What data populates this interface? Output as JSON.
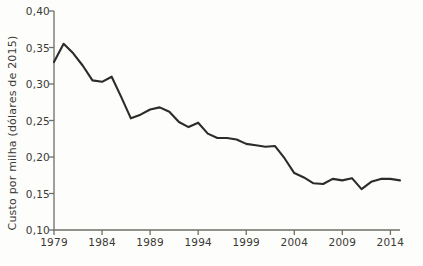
{
  "chart_data": {
    "type": "line",
    "title": "",
    "subtitle": "",
    "xlabel": "",
    "ylabel": "Custo por milha (dólares de 2015)",
    "xlim": [
      1979,
      2015
    ],
    "ylim": [
      0.1,
      0.4
    ],
    "grid": false,
    "legend": null,
    "legend_position": "none",
    "line_color": "#2b2b28",
    "background_color": "#fdfdfb",
    "axis_color": "#6f6f68",
    "y_ticks": [
      0.1,
      0.15,
      0.2,
      0.25,
      0.3,
      0.35,
      0.4
    ],
    "y_tick_labels": [
      "0,10",
      "0,15",
      "0,20",
      "0,25",
      "0,30",
      "0,35",
      "0,40"
    ],
    "x_ticks": [
      1979,
      1984,
      1989,
      1994,
      1999,
      2004,
      2009,
      2014
    ],
    "x_tick_labels": [
      "1979",
      "1984",
      "1989",
      "1994",
      "1999",
      "2004",
      "2009",
      "2014"
    ],
    "x": [
      1979,
      1980,
      1981,
      1982,
      1983,
      1984,
      1985,
      1986,
      1987,
      1988,
      1989,
      1990,
      1991,
      1992,
      1993,
      1994,
      1995,
      1996,
      1997,
      1998,
      1999,
      2000,
      2001,
      2002,
      2003,
      2004,
      2005,
      2006,
      2007,
      2008,
      2009,
      2010,
      2011,
      2012,
      2013,
      2014,
      2015
    ],
    "values": [
      0.33,
      0.355,
      0.342,
      0.325,
      0.305,
      0.303,
      0.31,
      0.282,
      0.253,
      0.258,
      0.265,
      0.268,
      0.262,
      0.248,
      0.241,
      0.247,
      0.232,
      0.226,
      0.226,
      0.224,
      0.218,
      0.216,
      0.214,
      0.215,
      0.198,
      0.178,
      0.172,
      0.164,
      0.163,
      0.17,
      0.168,
      0.171,
      0.156,
      0.166,
      0.17,
      0.17,
      0.168
    ],
    "series": [
      {
        "name": "Custo por milha",
        "values": [
          0.33,
          0.355,
          0.342,
          0.325,
          0.305,
          0.303,
          0.31,
          0.282,
          0.253,
          0.258,
          0.265,
          0.268,
          0.262,
          0.248,
          0.241,
          0.247,
          0.232,
          0.226,
          0.226,
          0.224,
          0.218,
          0.216,
          0.214,
          0.215,
          0.198,
          0.178,
          0.172,
          0.164,
          0.163,
          0.17,
          0.168,
          0.171,
          0.156,
          0.166,
          0.17,
          0.17,
          0.168
        ]
      }
    ]
  }
}
